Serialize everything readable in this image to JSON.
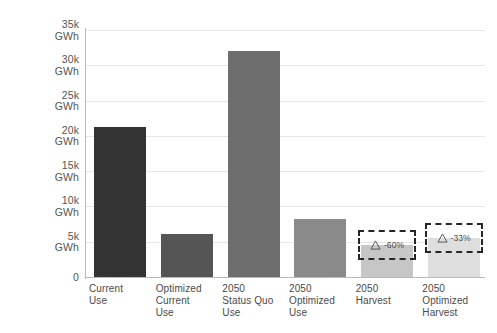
{
  "chart_data": {
    "type": "bar",
    "title": "",
    "subtitle": "",
    "xlabel": "",
    "ylabel": "",
    "ylim": [
      0,
      35000
    ],
    "grid": true,
    "legend": "none",
    "unit": "GWh",
    "categories": [
      "Current Use",
      "Optimized Current Use",
      "2050 Status Quo Use",
      "2050 Optimized Use",
      "2050 Harvest",
      "2050 Optimized Harvest"
    ],
    "category_lines": [
      [
        "Current",
        "Use"
      ],
      [
        "Optimized",
        "Current",
        "Use"
      ],
      [
        "2050",
        "Status Quo",
        "Use"
      ],
      [
        "2050",
        "Optimized",
        "Use"
      ],
      [
        "2050",
        "Harvest"
      ],
      [
        "2050",
        "Optimized",
        "Harvest"
      ]
    ],
    "values": [
      21200,
      6100,
      32000,
      8200,
      4500,
      5500
    ],
    "bar_colors": [
      "#333333",
      "#555555",
      "#6e6e6e",
      "#8a8a8a",
      "#c6c6c6",
      "#dedede"
    ],
    "y_ticks": [
      {
        "value": 35000,
        "line1": "35k",
        "line2": "GWh"
      },
      {
        "value": 30000,
        "line1": "30k",
        "line2": "GWh"
      },
      {
        "value": 25000,
        "line1": "25k",
        "line2": "GWh"
      },
      {
        "value": 20000,
        "line1": "20k",
        "line2": "GWh"
      },
      {
        "value": 15000,
        "line1": "15k",
        "line2": "GWh"
      },
      {
        "value": 10000,
        "line1": "10k",
        "line2": "GWh"
      },
      {
        "value": 5000,
        "line1": "5k",
        "line2": "GWh"
      },
      {
        "value": 0,
        "line1": "0",
        "line2": ""
      }
    ],
    "annotations": [
      {
        "category_index": 4,
        "label": "-60%",
        "icon": "delta-triangle-icon"
      },
      {
        "category_index": 5,
        "label": "-33%",
        "icon": "delta-triangle-icon"
      }
    ]
  },
  "colors": {
    "background": "#ffffff",
    "gridline": "#e6e6e6",
    "axis": "#b9b9b9",
    "tick_text": "#555555",
    "annotation_border": "#262626",
    "annotation_text": "#4d4d4d"
  }
}
